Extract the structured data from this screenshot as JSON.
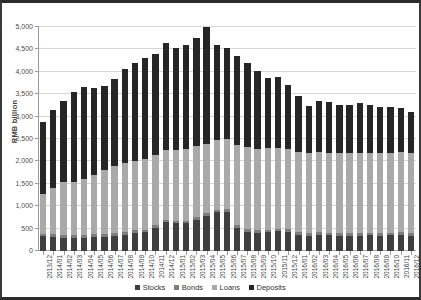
{
  "chart_data": {
    "type": "bar",
    "stacked": true,
    "title": "",
    "xlabel": "",
    "ylabel": "RMB billion",
    "ylim": [
      0,
      5000
    ],
    "ytick_step": 500,
    "ytick_labels": [
      "0",
      "500",
      "1,000",
      "1,500",
      "2,000",
      "2,500",
      "3,000",
      "3,500",
      "4,000",
      "4,500",
      "5,000"
    ],
    "grid": true,
    "legend_position": "bottom-center",
    "categories": [
      "2013/12",
      "2014/01",
      "2014/02",
      "2014/03",
      "2014/04",
      "2014/05",
      "2014/06",
      "2014/07",
      "2014/08",
      "2014/09",
      "2014/10",
      "2014/11",
      "2014/12",
      "2015/01",
      "2015/02",
      "2015/03",
      "2015/04",
      "2015/05",
      "2015/06",
      "2015/07",
      "2015/08",
      "2015/09",
      "2015/10",
      "2015/11",
      "2015/12",
      "2016/01",
      "2016/02",
      "2016/03",
      "2016/04",
      "2016/05",
      "2016/06",
      "2016/07",
      "2016/08",
      "2016/09",
      "2016/10",
      "2016/11",
      "2016/12"
    ],
    "series": [
      {
        "name": "Stocks",
        "color": "#3f3f3f",
        "values": [
          330,
          320,
          300,
          300,
          300,
          320,
          320,
          340,
          360,
          400,
          420,
          520,
          640,
          620,
          620,
          700,
          780,
          860,
          880,
          520,
          430,
          400,
          420,
          440,
          430,
          360,
          340,
          360,
          350,
          340,
          340,
          340,
          350,
          340,
          350,
          360,
          340
        ]
      },
      {
        "name": "Bonds",
        "color": "#7d7d7d",
        "values": [
          60,
          60,
          60,
          60,
          60,
          60,
          60,
          60,
          60,
          60,
          60,
          60,
          60,
          60,
          60,
          60,
          60,
          60,
          60,
          60,
          60,
          60,
          60,
          60,
          60,
          60,
          60,
          60,
          60,
          60,
          60,
          60,
          60,
          60,
          60,
          60,
          60
        ]
      },
      {
        "name": "Loans",
        "color": "#a9a9a9",
        "values": [
          890,
          1020,
          1180,
          1190,
          1250,
          1320,
          1420,
          1490,
          1550,
          1560,
          1570,
          1560,
          1560,
          1580,
          1600,
          1580,
          1560,
          1560,
          1560,
          1780,
          1830,
          1820,
          1810,
          1800,
          1790,
          1790,
          1790,
          1780,
          1780,
          1780,
          1780,
          1780,
          1780,
          1780,
          1780,
          1780,
          1780
        ]
      },
      {
        "name": "Deposits",
        "color": "#262626",
        "values": [
          1590,
          1740,
          1810,
          2000,
          2040,
          1950,
          1880,
          1960,
          2090,
          2170,
          2260,
          2260,
          2380,
          2270,
          2320,
          2410,
          2600,
          2120,
          2030,
          2000,
          1880,
          1730,
          1580,
          1580,
          1430,
          1240,
          1040,
          1150,
          1130,
          1070,
          1070,
          1120,
          1080,
          1040,
          1030,
          1000,
          920
        ]
      }
    ],
    "totals": [
      2870,
      3140,
      3350,
      3550,
      3650,
      3650,
      3680,
      3850,
      4060,
      4190,
      4310,
      4400,
      4640,
      4530,
      4600,
      4750,
      5000,
      4600,
      4530,
      4360,
      4200,
      4010,
      3870,
      3880,
      3710,
      3450,
      3230,
      3350,
      3320,
      3250,
      3250,
      3300,
      3270,
      3220,
      3220,
      3200,
      3100
    ]
  },
  "legend": {
    "items": [
      {
        "label": "Stocks",
        "color": "#3f3f3f"
      },
      {
        "label": "Bonds",
        "color": "#7d7d7d"
      },
      {
        "label": "Loans",
        "color": "#a9a9a9"
      },
      {
        "label": "Deposits",
        "color": "#262626"
      }
    ]
  }
}
